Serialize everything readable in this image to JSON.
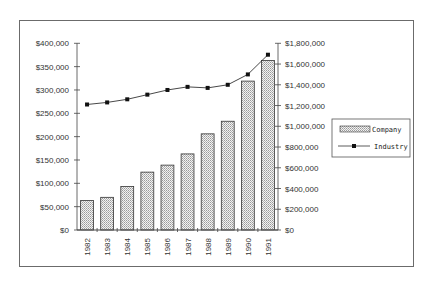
{
  "chart_data": {
    "type": "bar",
    "title": "",
    "xlabel": "",
    "ylabel": "",
    "categories": [
      "1982",
      "1983",
      "1984",
      "1985",
      "1986",
      "1987",
      "1988",
      "1989",
      "1990",
      "1991"
    ],
    "series": [
      {
        "name": "Company",
        "type": "bar",
        "axis": "left",
        "values": [
          63000,
          70000,
          93000,
          124000,
          139000,
          163000,
          206000,
          233000,
          319000,
          363000
        ]
      },
      {
        "name": "Industry",
        "type": "line",
        "axis": "right",
        "values": [
          1210000,
          1230000,
          1260000,
          1305000,
          1350000,
          1380000,
          1370000,
          1400000,
          1500000,
          1690000
        ]
      }
    ],
    "left_axis": {
      "ylim": [
        0,
        400000
      ],
      "ticks": [
        "$0",
        "$50,000",
        "$100,000",
        "$150,000",
        "$200,000",
        "$250,000",
        "$300,000",
        "$350,000",
        "$400,000"
      ]
    },
    "right_axis": {
      "ylim": [
        0,
        1800000
      ],
      "ticks": [
        "$0",
        "$200,000",
        "$400,000",
        "$600,000",
        "$800,000",
        "$1,000,000",
        "$1,200,000",
        "$1,400,000",
        "$1,600,000",
        "$1,800,000"
      ]
    },
    "grid": false,
    "legend": {
      "position": "right",
      "entries": [
        "Company",
        "Industry"
      ]
    },
    "colors": {
      "bar_fill": "#d9d9d9",
      "bar_stroke": "#333333",
      "line": "#333333",
      "marker": "#111111"
    }
  }
}
